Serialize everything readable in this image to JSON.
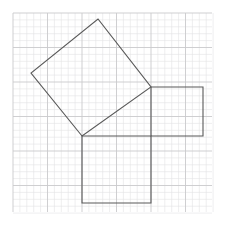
{
  "canvas": {
    "width": 229,
    "height": 234,
    "background_color": "#ffffff",
    "title": "Pythagorean theorem squares on graph paper"
  },
  "grid": {
    "label": "graph-paper-grid",
    "x_start": 13,
    "y_start": 13,
    "x_end": 212,
    "y_end": 212,
    "minor_cell_px": 6.9,
    "major_every_n_cells": 5,
    "minor_color": "#e2e2e4",
    "major_color": "#c9c9cc",
    "minor_width": 0.6,
    "major_width": 0.9
  },
  "shapes": {
    "stroke_color": "#595959",
    "stroke_width": 1.1,
    "fill": "none",
    "items": [
      {
        "name": "hypotenuse-square",
        "role": "square on hypotenuse",
        "points": "82,136 31,73 98,19 151,87",
        "vertices": [
          [
            82,
            136
          ],
          [
            31,
            73
          ],
          [
            98,
            19
          ],
          [
            151,
            87
          ]
        ],
        "orientation": "tilted"
      },
      {
        "name": "leg-b-square",
        "role": "square on horizontal leg",
        "points": "151,87 203,87 203,136 151,136",
        "vertices": [
          [
            151,
            87
          ],
          [
            203,
            87
          ],
          [
            203,
            136
          ],
          [
            151,
            136
          ]
        ],
        "orientation": "axis-aligned"
      },
      {
        "name": "leg-a-square",
        "role": "square on vertical leg",
        "points": "82,136 151,136 151,203 82,203",
        "vertices": [
          [
            82,
            136
          ],
          [
            151,
            136
          ],
          [
            151,
            203
          ],
          [
            82,
            203
          ]
        ],
        "orientation": "axis-aligned"
      }
    ],
    "right_angle_vertex": [
      82,
      136
    ]
  },
  "chart_data": {
    "type": "diagram",
    "xlabel": "",
    "ylabel": "",
    "grid": true,
    "legend": "none",
    "annotations": []
  }
}
